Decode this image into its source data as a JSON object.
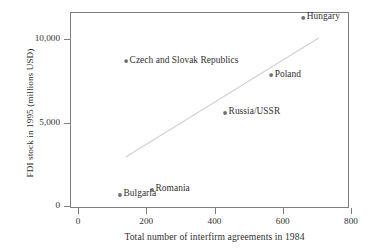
{
  "chart_data": {
    "type": "scatter",
    "title": "",
    "xlabel": "Total number of interfirm agreements in 1984",
    "ylabel": "FDI stock in 1995 (millions USD)",
    "xlim": [
      0,
      800
    ],
    "ylim": [
      0,
      11800
    ],
    "xticks": [
      0,
      200,
      400,
      600,
      800
    ],
    "xticklabels": [
      "0",
      "200",
      "400",
      "600",
      "800"
    ],
    "yticks": [
      0,
      5000,
      10000
    ],
    "yticklabels": [
      "0",
      "5,000",
      "10,000"
    ],
    "grid": false,
    "legend": "none",
    "marker_color": "#6e6e6e",
    "trendline_color": "#d0d0d0",
    "axis_color": "#7d7d7d",
    "text_color": "#2f2f2f",
    "points": [
      {
        "label": "Hungary",
        "x": 660,
        "y": 11260,
        "label_side": "right"
      },
      {
        "label": "Czech and Slovak Republics",
        "x": 141,
        "y": 8680,
        "label_side": "right"
      },
      {
        "label": "Poland",
        "x": 566,
        "y": 7840,
        "label_side": "right"
      },
      {
        "label": "Russia/USSR",
        "x": 431,
        "y": 5570,
        "label_side": "right"
      },
      {
        "label": "Romania",
        "x": 217,
        "y": 960,
        "label_side": "right"
      },
      {
        "label": "Bulgaria",
        "x": 123,
        "y": 660,
        "label_side": "right"
      }
    ],
    "trendline": {
      "x0": 140,
      "y0": 2930,
      "x1": 705,
      "y1": 10060
    }
  }
}
